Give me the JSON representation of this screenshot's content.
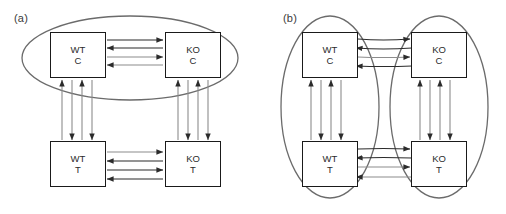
{
  "figure": {
    "type": "schematic-diagram",
    "panels": [
      {
        "id": "a",
        "label": "(a)",
        "grouping": "single horizontal ellipse enclosing the two control (C) nodes",
        "ellipse_count": 1,
        "nodes": [
          {
            "id": "wt-c",
            "line1": "WT",
            "line2": "C",
            "position": "top-left"
          },
          {
            "id": "ko-c",
            "line1": "KO",
            "line2": "C",
            "position": "top-right"
          },
          {
            "id": "wt-t",
            "line1": "WT",
            "line2": "T",
            "position": "bottom-left"
          },
          {
            "id": "ko-t",
            "line1": "KO",
            "line2": "T",
            "position": "bottom-right"
          }
        ],
        "connections": [
          {
            "id": "top-horizontal",
            "from": "wt-c",
            "to": "ko-c",
            "arrows": 4,
            "orientation": "horizontal"
          },
          {
            "id": "bottom-horizontal",
            "from": "wt-t",
            "to": "ko-t",
            "arrows": 4,
            "orientation": "horizontal"
          },
          {
            "id": "left-vertical",
            "from": "wt-c",
            "to": "wt-t",
            "arrows": 4,
            "orientation": "vertical"
          },
          {
            "id": "right-vertical",
            "from": "ko-c",
            "to": "ko-t",
            "arrows": 4,
            "orientation": "vertical"
          }
        ]
      },
      {
        "id": "b",
        "label": "(b)",
        "grouping": "two vertical ellipses enclosing the WT column and the KO column",
        "ellipse_count": 2,
        "nodes": [
          {
            "id": "wt-c",
            "line1": "WT",
            "line2": "C",
            "position": "top-left"
          },
          {
            "id": "ko-c",
            "line1": "KO",
            "line2": "C",
            "position": "top-right"
          },
          {
            "id": "wt-t",
            "line1": "WT",
            "line2": "T",
            "position": "bottom-left"
          },
          {
            "id": "ko-t",
            "line1": "KO",
            "line2": "T",
            "position": "bottom-right"
          }
        ],
        "connections": [
          {
            "id": "top-horizontal",
            "from": "wt-c",
            "to": "ko-c",
            "arrows": 4,
            "orientation": "horizontal"
          },
          {
            "id": "bottom-horizontal",
            "from": "wt-t",
            "to": "ko-t",
            "arrows": 4,
            "orientation": "horizontal"
          },
          {
            "id": "left-vertical",
            "from": "wt-c",
            "to": "wt-t",
            "arrows": 4,
            "orientation": "vertical"
          },
          {
            "id": "right-vertical",
            "from": "ko-c",
            "to": "ko-t",
            "arrows": 4,
            "orientation": "vertical"
          }
        ]
      }
    ],
    "arrow_pattern": {
      "horizontal_directions": [
        "right",
        "left",
        "right",
        "left"
      ],
      "vertical_directions": [
        "up",
        "down",
        "up",
        "down"
      ]
    },
    "colors": {
      "box_border": "#1a1a1a",
      "box_fill": "#ffffff",
      "ellipse_stroke": "#6b6b6b",
      "arrow_dark": "#2b2b2b",
      "arrow_light": "#8c8c8c",
      "text": "#2b2b2b",
      "background": "#ffffff"
    }
  }
}
